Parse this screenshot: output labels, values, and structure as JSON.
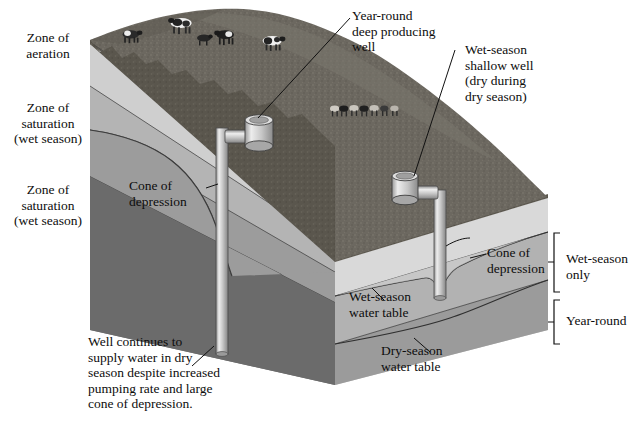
{
  "figure": {
    "type": "geological-block-diagram"
  },
  "labels": {
    "zone_aeration": "Zone of\naeration",
    "zone_saturation_wet_upper": "Zone of\nsaturation\n(wet season)",
    "zone_saturation_wet_lower": "Zone of\nsaturation\n(wet season)",
    "deep_well": "Year-round\ndeep producing\nwell",
    "shallow_well": "Wet-season\nshallow well\n(dry during\ndry season)",
    "cone_left": "Cone of\ndepression",
    "cone_right": "Cone of\ndepression",
    "wet_season_water_table": "Wet-season\nwater table",
    "dry_season_water_table": "Dry-season\nwater table",
    "bracket_wet": "Wet-season\nonly",
    "bracket_year": "Year-round",
    "caption": "Well continues to\nsupply water in dry\nseason despite increased\npumping rate and large\ncone of depression."
  },
  "icons": {
    "cow": "cow-icon",
    "pump": "water-pump-icon",
    "well_pipe": "well-pipe-icon",
    "bracket": "bracket-icon",
    "leader_line": "leader-line-icon"
  },
  "colors": {
    "background": "#ffffff",
    "grass_top": "#6e6a63",
    "grass_dark": "#565249",
    "aeration_left": "#c9c9c9",
    "aeration_front": "#dcdcdc",
    "saturation_upper_left": "#a9a9a9",
    "saturation_upper_front": "#c0c0c0",
    "saturation_lower_left": "#8f8f8f",
    "saturation_lower_front": "#a6a6a6",
    "deep_left": "#6d6d6d",
    "deep_front": "#949494",
    "bottom_band_left": "#7d7d7d",
    "bottom_band_front": "#9d9d9d",
    "pipe_light": "#e8e8e8",
    "pipe_mid": "#b9b9b9",
    "pipe_dark": "#8c8c8c",
    "outline": "#1d1d1d",
    "text": "#0d0d0d"
  },
  "geometry": {
    "top_left_corner": [
      90,
      40
    ],
    "front_corner": [
      335,
      262
    ],
    "right_corner": [
      547,
      198
    ],
    "block_bottom": 385,
    "left_face_bottom": 330,
    "right_edge": 548
  },
  "wells": [
    {
      "name": "deep-producing-well",
      "pipe_x": 222,
      "pump_x": 243,
      "pump_y": 120,
      "bottom_y": 352,
      "label": "Year-round\ndeep producing\nwell"
    },
    {
      "name": "shallow-well",
      "pipe_x": 440,
      "pump_x": 408,
      "pump_y": 178,
      "bottom_y": 297,
      "label": "Wet-season\nshallow well\n(dry during\ndry season)"
    }
  ],
  "cows": {
    "upper_herd_count": 5,
    "lower_herd_count": 7
  }
}
